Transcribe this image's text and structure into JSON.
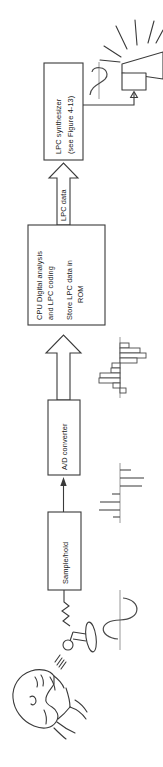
{
  "figure": {
    "orientation": "rotated-90-ccw",
    "caption_absent": true,
    "colors": {
      "ink": "#3a3a3a",
      "text": "#1b1b1b",
      "background": "#ffffff",
      "wave": "#4a4a4a",
      "axis": "#8d8d8d"
    }
  },
  "blocks": {
    "synthesizer": {
      "line1": "LPC synthesizer",
      "line2": "(see Figure 4-13)"
    },
    "cpu": {
      "line1": "CPU Digital analysis",
      "line2": "and LPC coding",
      "line3": "Store LPC data in",
      "line4": "ROM"
    },
    "adc": {
      "label": "A/D converter"
    },
    "sample_hold": {
      "label": "Sample/hold"
    }
  },
  "connectors": {
    "lpc_data_arrow": {
      "label": "LPC data"
    },
    "adc_to_cpu_arrow": {
      "label": ""
    },
    "sh_to_adc_arrow": {
      "label": ""
    },
    "synth_to_speaker_wire": {
      "label": ""
    },
    "mic_to_sh_wire": {
      "label": ""
    }
  },
  "icons": {
    "speaker": "loudspeaker-icon",
    "microphone": "microphone-icon",
    "talking_head": "talking-head-icon",
    "analog_waveform_output": "sine-waveform-icon",
    "analog_waveform_input": "sine-waveform-icon",
    "sampled_waveform": "sampled-signal-icon",
    "digitized_waveform": "quantized-signal-icon"
  },
  "signal_stages": [
    {
      "name": "synthesized-analog-output",
      "type": "sine-waveform"
    },
    {
      "name": "digitized-samples",
      "type": "quantized-bars"
    },
    {
      "name": "sampled-impulses",
      "type": "sample-lines"
    },
    {
      "name": "analog-speech-input",
      "type": "sine-waveform"
    }
  ]
}
